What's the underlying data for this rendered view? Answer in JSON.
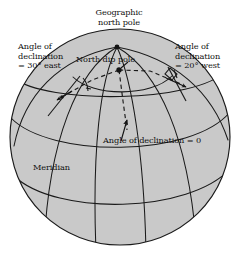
{
  "figure": {
    "kind": "earth-magnetic-declination-diagram",
    "colors": {
      "sphere_fill": "#c9c9c9",
      "sphere_edge": "#1a1a1a",
      "grid_line": "#1a1a1a",
      "dashed_line": "#1a1a1a",
      "text": "#101010",
      "background": "#ffffff"
    },
    "sphere": {
      "cx": 120,
      "cy": 137,
      "rx": 110,
      "ry": 108
    }
  },
  "labels": {
    "geographic_north_pole": "Geographic\nnorth pole",
    "geographic_north_pole_line1": "Geographic",
    "geographic_north_pole_line2": "north pole",
    "north_dip_pole": "North dip pole",
    "declination_east_line1": "Angle of",
    "declination_east_line2": "declination",
    "declination_east_line3": "= 30° east",
    "declination_west_line1": "Angle of",
    "declination_west_line2": "declination",
    "declination_west_line3": "= 20° west",
    "declination_zero": "Angle of declination = 0",
    "meridian": "Meridian"
  },
  "values": {
    "east_declination_degrees": "30",
    "east_declination_direction": "east",
    "west_declination_degrees": "20",
    "west_declination_direction": "west",
    "zero_declination": "0"
  },
  "markers": {
    "geographic_pole_point": {
      "x": 117,
      "y": 47
    },
    "dip_pole_point": {
      "x": 119,
      "y": 70
    },
    "east_site_point": {
      "x": 62,
      "y": 97
    },
    "west_site_point": {
      "x": 180,
      "y": 84
    },
    "zero_site_point": {
      "x": 127,
      "y": 133
    }
  }
}
